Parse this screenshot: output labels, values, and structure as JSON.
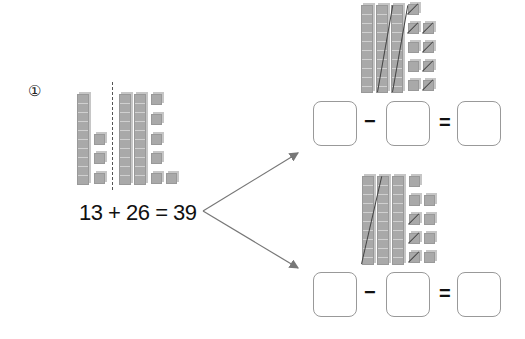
{
  "problem": {
    "number_label": "①"
  },
  "equation": {
    "text": "13 + 26 = 39"
  },
  "left_model": {
    "addend1": {
      "tens": 1,
      "ones": 3
    },
    "addend2": {
      "tens": 2,
      "ones": 6
    }
  },
  "top_model": {
    "tens": 3,
    "ones": 9,
    "crossed_tens": 2,
    "crossed_ones": 6
  },
  "bottom_model": {
    "tens": 3,
    "ones": 9,
    "crossed_tens": 1,
    "crossed_ones": 3
  },
  "top_sentence": {
    "minus": "−",
    "equals": "=",
    "box1": "",
    "box2": "",
    "box3": ""
  },
  "bottom_sentence": {
    "minus": "−",
    "equals": "=",
    "box1": "",
    "box2": "",
    "box3": ""
  },
  "colors": {
    "block": "#a9a9a9",
    "line": "#777777",
    "box_border": "#999999"
  }
}
